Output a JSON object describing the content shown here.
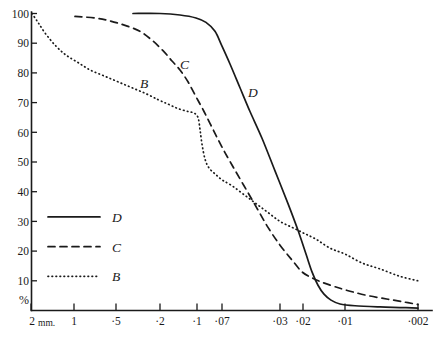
{
  "chart_data": {
    "type": "line",
    "title": "",
    "xlabel": "",
    "ylabel": "%",
    "x_unit": "mm.",
    "x_scale": "log-reversed",
    "x_tick_labels": [
      "2 mm.",
      "1",
      "·5",
      "·2",
      "·1",
      "·07",
      "·03",
      "·02",
      "·01",
      "·002"
    ],
    "x_tick_values": [
      2,
      1,
      0.5,
      0.2,
      0.1,
      0.07,
      0.03,
      0.02,
      0.01,
      0.002
    ],
    "x_tick_pixels": [
      31,
      74,
      116,
      160,
      197,
      222,
      280,
      303,
      345,
      418
    ],
    "y_tick_labels": [
      "100",
      "90",
      "80",
      "70",
      "60",
      "50",
      "40",
      "30",
      "20",
      "10"
    ],
    "y_tick_values": [
      100,
      90,
      80,
      70,
      60,
      50,
      40,
      30,
      20,
      10
    ],
    "ylim": [
      0,
      100
    ],
    "grid": false,
    "legend_position": "lower-left",
    "series": [
      {
        "name": "D",
        "style": "solid",
        "label_x": 248,
        "label_y": 97,
        "points": [
          [
            133,
            100
          ],
          [
            160,
            100
          ],
          [
            180,
            99.5
          ],
          [
            196,
            98.5
          ],
          [
            206,
            97
          ],
          [
            215,
            94
          ],
          [
            222,
            89
          ],
          [
            230,
            83
          ],
          [
            240,
            75
          ],
          [
            250,
            67
          ],
          [
            262,
            58
          ],
          [
            275,
            47
          ],
          [
            288,
            36
          ],
          [
            298,
            27
          ],
          [
            306,
            19
          ],
          [
            312,
            13
          ],
          [
            318,
            8.5
          ],
          [
            324,
            5.5
          ],
          [
            331,
            3.5
          ],
          [
            340,
            2.2
          ],
          [
            355,
            1.6
          ],
          [
            380,
            1.2
          ],
          [
            400,
            1.0
          ],
          [
            418,
            0.8
          ]
        ]
      },
      {
        "name": "C",
        "style": "dashed",
        "label_x": 180,
        "label_y": 69,
        "points": [
          [
            75,
            99
          ],
          [
            95,
            98.5
          ],
          [
            110,
            97.5
          ],
          [
            125,
            96
          ],
          [
            140,
            94
          ],
          [
            152,
            91
          ],
          [
            163,
            87.5
          ],
          [
            172,
            84
          ],
          [
            180,
            81
          ],
          [
            188,
            77
          ],
          [
            196,
            72
          ],
          [
            204,
            67
          ],
          [
            213,
            61
          ],
          [
            222,
            55
          ],
          [
            232,
            49
          ],
          [
            244,
            42
          ],
          [
            256,
            35
          ],
          [
            268,
            28
          ],
          [
            280,
            22
          ],
          [
            292,
            17
          ],
          [
            302,
            13
          ],
          [
            312,
            11
          ],
          [
            322,
            9.5
          ],
          [
            335,
            8
          ],
          [
            350,
            6.5
          ],
          [
            368,
            5
          ],
          [
            388,
            3.8
          ],
          [
            405,
            2.8
          ],
          [
            418,
            2.0
          ]
        ]
      },
      {
        "name": "B",
        "style": "dotted",
        "label_x": 140,
        "label_y": 88,
        "points": [
          [
            32,
            100
          ],
          [
            38,
            97
          ],
          [
            46,
            93
          ],
          [
            56,
            89
          ],
          [
            66,
            86
          ],
          [
            78,
            83.5
          ],
          [
            90,
            81
          ],
          [
            104,
            79
          ],
          [
            118,
            77
          ],
          [
            132,
            75
          ],
          [
            146,
            73
          ],
          [
            158,
            71
          ],
          [
            168,
            69.5
          ],
          [
            178,
            68
          ],
          [
            188,
            67
          ],
          [
            194,
            66.5
          ],
          [
            198,
            65
          ],
          [
            200,
            61
          ],
          [
            202,
            56
          ],
          [
            205,
            51
          ],
          [
            209,
            48
          ],
          [
            215,
            46
          ],
          [
            222,
            44
          ],
          [
            232,
            42
          ],
          [
            244,
            39
          ],
          [
            256,
            36
          ],
          [
            268,
            33
          ],
          [
            280,
            30
          ],
          [
            292,
            28
          ],
          [
            304,
            26
          ],
          [
            316,
            24
          ],
          [
            330,
            21
          ],
          [
            345,
            19
          ],
          [
            362,
            16
          ],
          [
            380,
            14
          ],
          [
            400,
            11.5
          ],
          [
            418,
            10
          ]
        ]
      }
    ],
    "legend": [
      {
        "label": "D",
        "style": "solid"
      },
      {
        "label": "C",
        "style": "dashed"
      },
      {
        "label": "B",
        "style": "dotted"
      }
    ]
  },
  "axis": {
    "percent_symbol": "%"
  }
}
